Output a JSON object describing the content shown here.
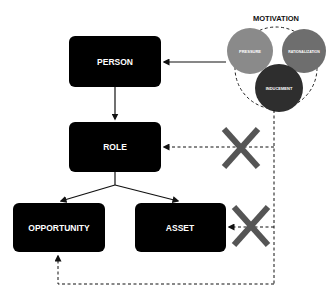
{
  "motivation": {
    "title": "MOTIVATION",
    "circles": [
      {
        "label": "PRESSURE",
        "color": "#8a8a8a"
      },
      {
        "label": "RATIONALIZATION",
        "color": "#6e6e6e"
      },
      {
        "label": "INDUCEMENT",
        "color": "#333333"
      }
    ]
  },
  "nodes": {
    "person": "PERSON",
    "role": "ROLE",
    "opportunity": "OPPORTUNITY",
    "asset": "ASSET"
  },
  "colors": {
    "box": "#000000",
    "cross": "#5a5a5a",
    "line": "#111111"
  },
  "edges": [
    {
      "from": "motivation",
      "to": "person",
      "style": "solid"
    },
    {
      "from": "person",
      "to": "role",
      "style": "solid"
    },
    {
      "from": "role",
      "to": "opportunity",
      "style": "solid"
    },
    {
      "from": "role",
      "to": "asset",
      "style": "solid"
    },
    {
      "from": "motivation",
      "to": "role",
      "style": "dashed",
      "blocked": true
    },
    {
      "from": "motivation",
      "to": "asset",
      "style": "dashed",
      "blocked": true
    },
    {
      "from": "motivation",
      "to": "opportunity",
      "style": "dashed"
    }
  ]
}
